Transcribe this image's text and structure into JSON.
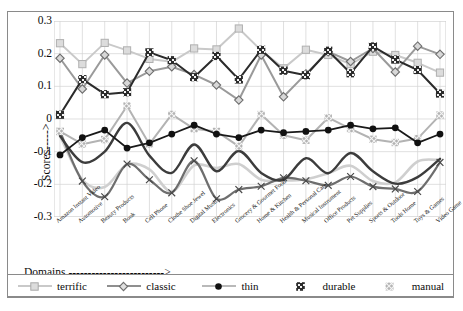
{
  "chart_data": {
    "type": "line",
    "title": "",
    "xlabel": "Domains ------------------------->",
    "ylabel": "Scores----->",
    "ylim": [
      -0.3,
      0.3
    ],
    "yticks": [
      "0.3",
      "0.2",
      "0.1",
      "0",
      "-0.1",
      "-0.2",
      "-0.3"
    ],
    "ytick_values": [
      0.3,
      0.2,
      0.1,
      0,
      -0.1,
      -0.2,
      -0.3
    ],
    "grid": true,
    "legend_position": "bottom",
    "categories": [
      "Amazon Instant Video",
      "Automotive",
      "Beauty Products",
      "Book",
      "Cell Phone",
      "Clothe Shoe Jewel",
      "Digital Music",
      "Electronics",
      "Grocery & Gourmet Food",
      "Home & Kitchen",
      "Health & Personal Care",
      "Musical Instrument",
      "Office Products",
      "Pet Supplies",
      "Sports & Outdoor",
      "Tools Home",
      "Toys & Games",
      "Video Game"
    ],
    "series": [
      {
        "name": "terrific",
        "color": "#c9c9c9",
        "marker": "square-light",
        "values": [
          0.232,
          0.168,
          0.233,
          0.21,
          0.184,
          0.175,
          0.216,
          0.213,
          0.277,
          0.21,
          0.155,
          0.212,
          0.196,
          0.168,
          0.206,
          0.196,
          0.172,
          0.142
        ]
      },
      {
        "name": "classic",
        "color": "#9a9a9a",
        "marker": "diamond",
        "values": [
          0.186,
          0.092,
          0.196,
          0.11,
          0.146,
          0.16,
          0.136,
          0.104,
          0.058,
          0.196,
          0.068,
          0.138,
          0.206,
          0.176,
          0.216,
          0.144,
          0.223,
          0.198
        ]
      },
      {
        "name": "thin",
        "color": "#1a1a1a",
        "marker": "circle",
        "values": [
          -0.11,
          -0.057,
          -0.034,
          -0.089,
          -0.073,
          -0.046,
          -0.019,
          -0.046,
          -0.057,
          -0.034,
          -0.042,
          -0.038,
          -0.034,
          -0.019,
          -0.03,
          -0.027,
          -0.073,
          -0.046
        ]
      },
      {
        "name": "durable",
        "color": "#2b2b2b",
        "marker": "square-hatch",
        "values": [
          0.013,
          0.122,
          0.076,
          0.082,
          0.204,
          0.18,
          0.128,
          0.193,
          0.121,
          0.212,
          0.148,
          0.134,
          0.209,
          0.14,
          0.222,
          0.182,
          0.15,
          0.078
        ]
      },
      {
        "name": "manual",
        "color": "#b3b3b3",
        "marker": "square-x",
        "values": [
          -0.038,
          -0.077,
          -0.063,
          0.04,
          -0.077,
          0.014,
          -0.03,
          -0.038,
          -0.084,
          0.014,
          -0.05,
          -0.065,
          0.004,
          -0.03,
          -0.062,
          -0.072,
          -0.06,
          0.012
        ]
      },
      {
        "name": "lower-dark-curve",
        "color": "#3c3c3c",
        "marker": "none",
        "values": [
          -0.052,
          -0.132,
          -0.1,
          -0.012,
          -0.112,
          -0.165,
          -0.078,
          -0.16,
          -0.098,
          -0.165,
          -0.186,
          -0.12,
          -0.166,
          -0.104,
          -0.16,
          -0.198,
          -0.178,
          -0.122
        ]
      },
      {
        "name": "lower-mid-curve",
        "color": "#6e6e6e",
        "marker": "cross",
        "values": [
          -0.038,
          -0.19,
          -0.238,
          -0.138,
          -0.186,
          -0.226,
          -0.128,
          -0.244,
          -0.216,
          -0.206,
          -0.18,
          -0.189,
          -0.203,
          -0.176,
          -0.207,
          -0.214,
          -0.222,
          -0.133
        ]
      },
      {
        "name": "lower-light-curve",
        "color": "#cfcfcf",
        "marker": "none",
        "values": [
          -0.052,
          -0.186,
          -0.208,
          -0.14,
          -0.154,
          -0.222,
          -0.142,
          -0.15,
          -0.138,
          -0.186,
          -0.188,
          -0.184,
          -0.166,
          -0.143,
          -0.19,
          -0.194,
          -0.13,
          -0.126
        ]
      }
    ],
    "legend": [
      {
        "label": "terrific",
        "color": "#c9c9c9",
        "marker": "square-light"
      },
      {
        "label": "classic",
        "color": "#8f8f8f",
        "marker": "diamond"
      },
      {
        "label": "thin",
        "color": "#b9b9b9",
        "marker": "circle"
      },
      {
        "label": "durable",
        "color": "#8f8f8f",
        "marker": "square-hatch"
      },
      {
        "label": "manual",
        "color": "#c9c9c9",
        "marker": "square-x"
      }
    ]
  },
  "caption": ""
}
